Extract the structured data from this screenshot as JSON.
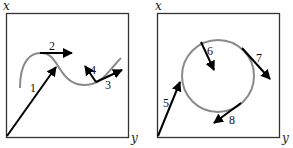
{
  "panels": [
    {
      "id": "left",
      "axis_labels": {
        "vertical": "x",
        "horizontal": "y"
      },
      "curve": "wavy trajectory",
      "vectors": [
        {
          "label": "1",
          "type": "position"
        },
        {
          "label": "2",
          "type": "tangent"
        },
        {
          "label": "3",
          "type": "tangent"
        },
        {
          "label": "4",
          "type": "normal"
        }
      ]
    },
    {
      "id": "right",
      "axis_labels": {
        "vertical": "x",
        "horizontal": "y"
      },
      "curve": "circle",
      "vectors": [
        {
          "label": "5",
          "type": "position"
        },
        {
          "label": "6",
          "type": "normal (inward)"
        },
        {
          "label": "7",
          "type": "tangent"
        },
        {
          "label": "8",
          "type": "tangent"
        }
      ]
    }
  ],
  "colors": {
    "frame": "#333333",
    "curve": "#8a8a8a",
    "arrow": "#000000"
  }
}
